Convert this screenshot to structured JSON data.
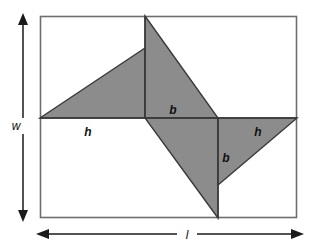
{
  "figure": {
    "background_color": "#ffffff",
    "shape_fill_color": "#8c8c8c",
    "shape_stroke_color": "#333333",
    "rectangle_stroke_color": "#666666",
    "arrow_color": "#1a1a1a",
    "text_color": "#111111",
    "rectangle": {
      "x": 40,
      "y": 16,
      "width": 257,
      "height": 202
    },
    "triangles": [
      {
        "name": "upper-left-triangle",
        "points": "40,118 145,118 145,48"
      },
      {
        "name": "upper-center-triangle",
        "points": "145,16 145,118 218,118"
      },
      {
        "name": "lower-center-triangle",
        "points": "145,118 218,118 218,218"
      },
      {
        "name": "lower-right-triangle",
        "points": "218,118 297,118 218,185"
      }
    ],
    "labels": [
      {
        "name": "label-h-left",
        "text": "h",
        "x": 88,
        "y": 136
      },
      {
        "name": "label-b-upper",
        "text": "b",
        "x": 173,
        "y": 114
      },
      {
        "name": "label-b-lower",
        "text": "b",
        "x": 226,
        "y": 162
      },
      {
        "name": "label-h-right",
        "text": "h",
        "x": 258,
        "y": 136
      }
    ],
    "dimensions": [
      {
        "name": "width-dimension",
        "label": "w",
        "orientation": "vertical",
        "x": 23,
        "y1": 16,
        "y2": 219,
        "label_x": 16,
        "label_y": 129
      },
      {
        "name": "length-dimension",
        "label": "l",
        "orientation": "horizontal",
        "y": 234,
        "x1": 38,
        "x2": 303,
        "label_x": 187,
        "label_y": 239
      }
    ]
  }
}
